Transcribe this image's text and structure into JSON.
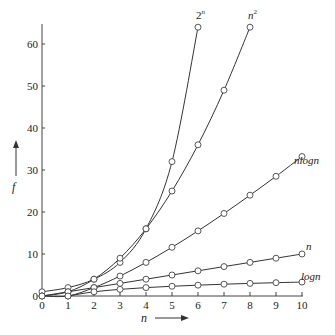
{
  "chart_data": {
    "type": "line",
    "title": "",
    "xlabel": "n",
    "ylabel": "f",
    "xlim": [
      0,
      10
    ],
    "ylim": [
      0,
      64
    ],
    "x_ticks": [
      "0",
      "1",
      "2",
      "3",
      "4",
      "5",
      "6",
      "7",
      "8",
      "9",
      "10"
    ],
    "y_ticks": [
      "0",
      "10",
      "20",
      "30",
      "40",
      "50",
      "60"
    ],
    "grid": false,
    "legend": "inline labels at curve ends",
    "series": [
      {
        "name": "2^n",
        "label": "2ⁿ",
        "x": [
          0,
          1,
          2,
          3,
          4,
          5,
          6
        ],
        "values": [
          1,
          2,
          4,
          8,
          16,
          32,
          64
        ]
      },
      {
        "name": "n^2",
        "label": "n²",
        "x": [
          0,
          1,
          2,
          3,
          4,
          5,
          6,
          7,
          8
        ],
        "values": [
          0,
          1,
          4,
          9,
          16,
          25,
          36,
          49,
          64
        ]
      },
      {
        "name": "nlogn",
        "label": "nlogn",
        "x": [
          0,
          1,
          2,
          3,
          4,
          5,
          6,
          7,
          8,
          9,
          10
        ],
        "values": [
          0,
          0,
          2,
          4.75,
          8,
          11.6,
          15.5,
          19.65,
          24,
          28.5,
          33.2
        ]
      },
      {
        "name": "n",
        "label": "n",
        "x": [
          0,
          1,
          2,
          3,
          4,
          5,
          6,
          7,
          8,
          9,
          10
        ],
        "values": [
          0,
          1,
          2,
          3,
          4,
          5,
          6,
          7,
          8,
          9,
          10
        ]
      },
      {
        "name": "logn",
        "label": "logn",
        "x": [
          1,
          2,
          3,
          4,
          5,
          6,
          7,
          8,
          9,
          10
        ],
        "values": [
          0,
          1,
          1.58,
          2,
          2.32,
          2.58,
          2.81,
          3,
          3.17,
          3.32
        ]
      }
    ]
  },
  "labels": {
    "x_axis": "n",
    "y_axis": "f",
    "two_n": "2",
    "two_n_sup": "n",
    "n_sq": "n",
    "n_sq_sup": "2",
    "nlogn": "nlogn",
    "n": "n",
    "logn": "logn"
  }
}
